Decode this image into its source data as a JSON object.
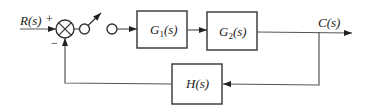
{
  "diagram": {
    "type": "block-diagram",
    "input": {
      "label": "R(s)"
    },
    "output": {
      "label": "C(s)"
    },
    "summing_junction": {
      "plus_sign": "+",
      "minus_sign": "−"
    },
    "switch": {
      "description": "sampler / switch"
    },
    "blocks": [
      {
        "id": "G1",
        "label": "G1(s)",
        "main": "G",
        "sub": "1",
        "tail": "(s)"
      },
      {
        "id": "G2",
        "label": "G2(s)",
        "main": "G",
        "sub": "2",
        "tail": "(s)"
      },
      {
        "id": "H",
        "label": "H(s)"
      }
    ],
    "connections": [
      "R(s) -> summing junction (+)",
      "summing junction -> switch",
      "switch -> G1(s)",
      "G1(s) -> G2(s)",
      "G2(s) -> C(s)",
      "C(s) -> H(s)",
      "H(s) -> summing junction (−)"
    ]
  }
}
